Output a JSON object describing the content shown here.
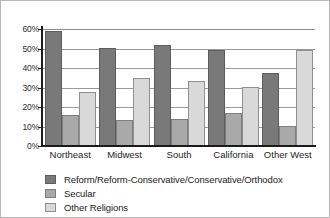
{
  "chart_data": {
    "type": "bar",
    "title": "",
    "subtitle": "",
    "xlabel": "",
    "ylabel": "",
    "categories": [
      "Northeast",
      "Midwest",
      "South",
      "California",
      "Other West"
    ],
    "series": [
      {
        "name": "Reform/Reform-Conservative/Conservative/Orthodox",
        "color": "#797979",
        "values": [
          59,
          50.5,
          52,
          49,
          37.5
        ]
      },
      {
        "name": "Secular",
        "color": "#a9a9a9",
        "values": [
          16,
          13.5,
          14,
          17,
          10.5
        ]
      },
      {
        "name": "Other Religions",
        "color": "#d9d9d9",
        "values": [
          27.5,
          35,
          33.5,
          30.5,
          49
        ]
      }
    ],
    "ylim": [
      0,
      60
    ],
    "ytick_values": [
      0,
      10,
      20,
      30,
      40,
      50,
      60
    ],
    "ytick_labels": [
      "0%",
      "10%",
      "20%",
      "30%",
      "40%",
      "50%",
      "60%"
    ],
    "grid": true,
    "grid_axis": "y",
    "legend_position": "bottom-left",
    "legend_entries": [
      "Reform/Reform-Conservative/Conservative/Orthodox",
      "Secular",
      "Other Religions"
    ]
  }
}
